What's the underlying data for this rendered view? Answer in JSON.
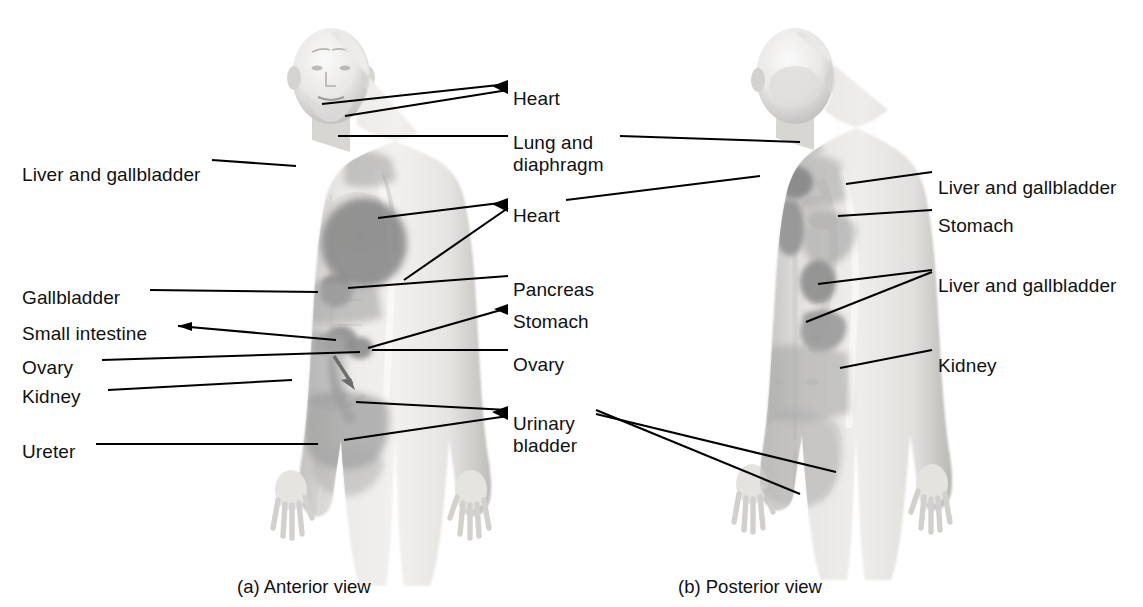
{
  "figure": {
    "title_partial": "",
    "panels": [
      {
        "id": "a",
        "caption": "(a) Anterior view"
      },
      {
        "id": "b",
        "caption": "(b) Posterior view"
      }
    ]
  },
  "colors": {
    "zone_dark": "#8d8d8d",
    "zone_mid": "#9e9e9e",
    "zone_light": "#adadad",
    "body_fill": "#e2e1df",
    "body_shade": "#c9c7c5",
    "leader_line": "#000000",
    "label_text": "#111111",
    "background": "#ffffff"
  },
  "labels": {
    "left_column": [
      {
        "key": "liver-gallbladder-ant",
        "text": "Liver and gallbladder",
        "x": 22,
        "y": 164
      },
      {
        "key": "gallbladder-ant",
        "text": "Gallbladder",
        "x": 22,
        "y": 287
      },
      {
        "key": "small-intestine-ant",
        "text": "Small intestine",
        "x": 22,
        "y": 323
      },
      {
        "key": "ovary-ant-left",
        "text": "Ovary",
        "x": 22,
        "y": 357
      },
      {
        "key": "kidney-ant-left",
        "text": "Kidney",
        "x": 22,
        "y": 386
      },
      {
        "key": "ureter-ant",
        "text": "Ureter",
        "x": 22,
        "y": 441
      }
    ],
    "center_column": [
      {
        "key": "heart-ant-neck",
        "text": "Heart",
        "x": 513,
        "y": 88
      },
      {
        "key": "lung-diaphragm",
        "text": "Lung and",
        "x": 513,
        "y": 132
      },
      {
        "key": "lung-diaphragm2",
        "text": "diaphragm",
        "x": 513,
        "y": 154
      },
      {
        "key": "heart-ant-chest",
        "text": "Heart",
        "x": 513,
        "y": 205
      },
      {
        "key": "pancreas",
        "text": "Pancreas",
        "x": 513,
        "y": 279
      },
      {
        "key": "stomach-ant",
        "text": "Stomach",
        "x": 513,
        "y": 311
      },
      {
        "key": "ovary-ant-ctr",
        "text": "Ovary",
        "x": 513,
        "y": 354
      },
      {
        "key": "urinary-bladder",
        "text": "Urinary",
        "x": 513,
        "y": 413
      },
      {
        "key": "urinary-bladder2",
        "text": "bladder",
        "x": 513,
        "y": 435
      }
    ],
    "right_column": [
      {
        "key": "liver-gallbladder-post-1",
        "text": "Liver and gallbladder",
        "x": 938,
        "y": 177
      },
      {
        "key": "stomach-post",
        "text": "Stomach",
        "x": 938,
        "y": 215
      },
      {
        "key": "liver-gallbladder-post-2",
        "text": "Liver and gallbladder",
        "x": 938,
        "y": 275
      },
      {
        "key": "kidney-post",
        "text": "Kidney",
        "x": 938,
        "y": 355
      }
    ],
    "captions": [
      {
        "key": "caption-anterior",
        "text": "(a) Anterior view",
        "x": 237,
        "y": 576
      },
      {
        "key": "caption-posterior",
        "text": "(b) Posterior view",
        "x": 678,
        "y": 576
      }
    ]
  },
  "referred_pain_regions": {
    "anterior": [
      {
        "name": "heart-jaw",
        "organ": "Heart",
        "shade": "light"
      },
      {
        "name": "heart-chest",
        "organ": "Heart",
        "shade": "dark"
      },
      {
        "name": "lung-diaphragm-neck",
        "organ": "Lung and diaphragm",
        "shade": "mid"
      },
      {
        "name": "liver-gallbladder-shoulder",
        "organ": "Liver and gallbladder",
        "shade": "mid"
      },
      {
        "name": "pancreas-epigastric",
        "organ": "Pancreas",
        "shade": "dark"
      },
      {
        "name": "stomach-epigastric",
        "organ": "Stomach",
        "shade": "dark"
      },
      {
        "name": "gallbladder-mid",
        "organ": "Gallbladder",
        "shade": "mid"
      },
      {
        "name": "small-intestine-periumbilical",
        "organ": "Small intestine",
        "shade": "mid"
      },
      {
        "name": "ovary-lower",
        "organ": "Ovary",
        "shade": "dark"
      },
      {
        "name": "kidney-flank",
        "organ": "Kidney",
        "shade": "light"
      },
      {
        "name": "ureter-groin",
        "organ": "Ureter",
        "shade": "mid"
      },
      {
        "name": "urinary-bladder-suprapubic",
        "organ": "Urinary bladder",
        "shade": "mid"
      }
    ],
    "posterior": [
      {
        "name": "liver-gallbladder-scapula",
        "organ": "Liver and gallbladder",
        "shade": "dark"
      },
      {
        "name": "stomach-interscapular",
        "organ": "Stomach",
        "shade": "mid"
      },
      {
        "name": "liver-gallbladder-flank",
        "organ": "Liver and gallbladder",
        "shade": "mid"
      },
      {
        "name": "lung-diaphragm-nape",
        "organ": "Lung and diaphragm",
        "shade": "light"
      },
      {
        "name": "kidney-lumbar",
        "organ": "Kidney",
        "shade": "light"
      },
      {
        "name": "urinary-bladder-buttock",
        "organ": "Urinary bladder",
        "shade": "light"
      }
    ]
  }
}
